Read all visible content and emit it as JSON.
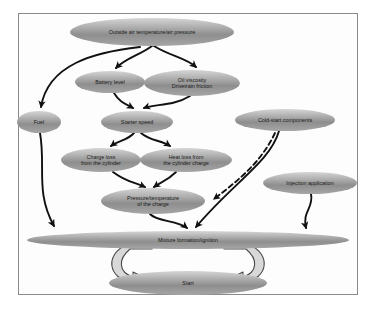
{
  "diagram": {
    "frame": {
      "border_color": "#8a8a8a",
      "background": "#fdfdfd"
    },
    "node_fill": {
      "light": "#c9c9c9",
      "mid": "#9a9a9a",
      "dark": "#8f8f8f"
    },
    "arrow_color": "#111111",
    "nodes": [
      {
        "id": "outside-air",
        "label_lines": [
          "Outside air temperature/air pressure"
        ],
        "cx": 152,
        "cy": 32,
        "rx": 82,
        "ry": 14
      },
      {
        "id": "battery-level",
        "label_lines": [
          "Battery level"
        ],
        "cx": 110,
        "cy": 82,
        "rx": 35,
        "ry": 11
      },
      {
        "id": "oil-viscosity",
        "label_lines": [
          "Oil viscosity",
          "Drivetrain friction"
        ],
        "cx": 192,
        "cy": 83,
        "rx": 48,
        "ry": 13
      },
      {
        "id": "fuel",
        "label_lines": [
          "Fuel"
        ],
        "cx": 39,
        "cy": 122,
        "rx": 22,
        "ry": 11
      },
      {
        "id": "starter-speed",
        "label_lines": [
          "Starter speed"
        ],
        "cx": 137,
        "cy": 122,
        "rx": 36,
        "ry": 11
      },
      {
        "id": "cold-start-components",
        "label_lines": [
          "Cold-start components"
        ],
        "cx": 285,
        "cy": 120,
        "rx": 50,
        "ry": 11
      },
      {
        "id": "charge-loss",
        "label_lines": [
          "Charge loss",
          "from the cylinder"
        ],
        "cx": 101,
        "cy": 160,
        "rx": 40,
        "ry": 12
      },
      {
        "id": "heat-loss",
        "label_lines": [
          "Heat loss from",
          "the cylinder charge"
        ],
        "cx": 186,
        "cy": 160,
        "rx": 46,
        "ry": 12
      },
      {
        "id": "pressure-temperature",
        "label_lines": [
          "Pressure/temperature",
          "of the charge"
        ],
        "cx": 153,
        "cy": 201,
        "rx": 52,
        "ry": 13
      },
      {
        "id": "injection-application",
        "label_lines": [
          "Injection application"
        ],
        "cx": 310,
        "cy": 183,
        "rx": 47,
        "ry": 11
      },
      {
        "id": "mixture-formation",
        "label_lines": [
          "Mixture formation/ignition"
        ],
        "cx": 188,
        "cy": 240,
        "rx": 161,
        "ry": 9
      },
      {
        "id": "start",
        "label_lines": [
          "Start"
        ],
        "cx": 188,
        "cy": 283,
        "rx": 79,
        "ry": 12
      }
    ],
    "edges": [
      {
        "id": "outside-to-fuel",
        "from": "outside-air",
        "to": "fuel",
        "style": "solid"
      },
      {
        "id": "outside-to-battery",
        "from": "outside-air",
        "to": "battery-level",
        "style": "solid"
      },
      {
        "id": "outside-to-oil",
        "from": "outside-air",
        "to": "oil-viscosity",
        "style": "solid"
      },
      {
        "id": "battery-to-starter",
        "from": "battery-level",
        "to": "starter-speed",
        "style": "solid"
      },
      {
        "id": "oil-to-starter",
        "from": "oil-viscosity",
        "to": "starter-speed",
        "style": "solid"
      },
      {
        "id": "starter-to-charge-loss",
        "from": "starter-speed",
        "to": "charge-loss",
        "style": "solid"
      },
      {
        "id": "starter-to-heat-loss",
        "from": "starter-speed",
        "to": "heat-loss",
        "style": "solid"
      },
      {
        "id": "charge-loss-to-pressure",
        "from": "charge-loss",
        "to": "pressure-temperature",
        "style": "solid"
      },
      {
        "id": "heat-loss-to-pressure",
        "from": "heat-loss",
        "to": "pressure-temperature",
        "style": "solid"
      },
      {
        "id": "fuel-to-mixture",
        "from": "fuel",
        "to": "mixture-formation",
        "style": "solid"
      },
      {
        "id": "pressure-to-mixture",
        "from": "pressure-temperature",
        "to": "mixture-formation",
        "style": "solid"
      },
      {
        "id": "coldstart-to-mixture",
        "from": "cold-start-components",
        "to": "mixture-formation",
        "style": "solid"
      },
      {
        "id": "coldstart-to-pressure",
        "from": "cold-start-components",
        "to": "pressure-temperature",
        "style": "dashed"
      },
      {
        "id": "injection-to-mixture",
        "from": "injection-application",
        "to": "mixture-formation",
        "style": "solid"
      },
      {
        "id": "mixture-to-start-loop",
        "from": "mixture-formation",
        "to": "start",
        "style": "hollow-loop"
      },
      {
        "id": "start-to-mixture-loop",
        "from": "start",
        "to": "mixture-formation",
        "style": "hollow-loop"
      }
    ]
  }
}
